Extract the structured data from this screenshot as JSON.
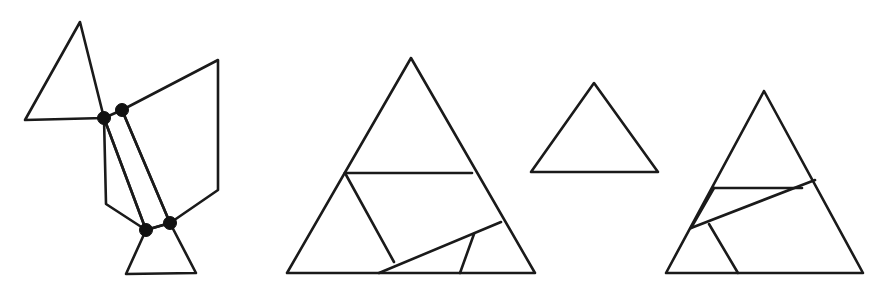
{
  "page": {
    "background_color": "#ffffff",
    "stroke_color": "#1a1a1a",
    "dot_color": "#111111",
    "width": 886,
    "height": 292,
    "figure_count": 4
  },
  "figures": [
    {
      "id": "figure-1",
      "name": "unfolded-hinged-dissection",
      "label": "",
      "description": "Chain of four polygons joined at four marked hinge points",
      "stroke_width": 2.6,
      "pieces": [
        {
          "name": "upper-left-triangle",
          "type": "polygon",
          "points": "80,22 25,120 104,118"
        },
        {
          "name": "right-quadrilateral",
          "type": "polygon",
          "points": "122,110 218,60 218,190 170,223"
        },
        {
          "name": "narrow-strip-quadrilateral",
          "type": "polygon",
          "points": "104,118 122,110 170,223 146,230"
        },
        {
          "name": "left-lower-polygon",
          "type": "polygon",
          "points": "104,118 106,204 146,230"
        },
        {
          "name": "bottom-trapezoid",
          "type": "polygon",
          "points": "146,230 170,223 196,273 126,274"
        }
      ],
      "hinge_dots": [
        {
          "name": "hinge-dot-upper-left",
          "cx": 104,
          "cy": 118,
          "r": 6.5
        },
        {
          "name": "hinge-dot-upper-right",
          "cx": 122,
          "cy": 110,
          "r": 6.5
        },
        {
          "name": "hinge-dot-lower-left",
          "cx": 146,
          "cy": 230,
          "r": 6.5
        },
        {
          "name": "hinge-dot-lower-right",
          "cx": 170,
          "cy": 223,
          "r": 6.5
        }
      ]
    },
    {
      "id": "figure-2",
      "name": "dissected-triangle-left",
      "label": "",
      "description": "Equilateral triangle cut into four pieces",
      "stroke_width": 2.6,
      "outline": {
        "name": "triangle-outline",
        "type": "polygon",
        "points": "411,58 287,273 535,273"
      },
      "cut_lines": [
        {
          "name": "cut-horizontal",
          "x1": 345,
          "y1": 173,
          "x2": 472,
          "y2": 173
        },
        {
          "name": "cut-left-diagonal",
          "x1": 345,
          "y1": 173,
          "x2": 394,
          "y2": 262
        },
        {
          "name": "cut-long-diagonal",
          "x1": 379,
          "y1": 273,
          "x2": 501,
          "y2": 222
        },
        {
          "name": "cut-short-vertical",
          "x1": 474,
          "y1": 234,
          "x2": 460,
          "y2": 273
        }
      ]
    },
    {
      "id": "figure-3",
      "name": "plain-triangle",
      "label": "",
      "description": "Small undivided equilateral triangle",
      "stroke_width": 2.6,
      "outline": {
        "name": "triangle-outline",
        "type": "polygon",
        "points": "594,83 531,172 658,172"
      },
      "cut_lines": []
    },
    {
      "id": "figure-4",
      "name": "dissected-triangle-right",
      "label": "",
      "description": "Equilateral triangle cut into four pieces, alternate arrangement",
      "stroke_width": 2.6,
      "outline": {
        "name": "triangle-outline",
        "type": "polygon",
        "points": "764,91 666,273 863,273"
      },
      "cut_lines": [
        {
          "name": "cut-horizontal",
          "x1": 714,
          "y1": 188,
          "x2": 802,
          "y2": 188
        },
        {
          "name": "cut-long-diagonal",
          "x1": 691,
          "y1": 228,
          "x2": 815,
          "y2": 180
        },
        {
          "name": "cut-left-short-diagonal",
          "x1": 691,
          "y1": 228,
          "x2": 714,
          "y2": 188
        },
        {
          "name": "cut-lower-diagonal",
          "x1": 709,
          "y1": 224,
          "x2": 738,
          "y2": 273
        }
      ]
    }
  ]
}
